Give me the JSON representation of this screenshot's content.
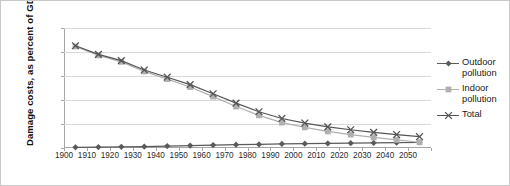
{
  "chart_data": {
    "type": "line",
    "title": "",
    "xlabel": "",
    "ylabel": "Damage costs, as percent of GDP",
    "x": [
      1905,
      1915,
      1925,
      1935,
      1945,
      1955,
      1965,
      1975,
      1985,
      1995,
      2005,
      2015,
      2025,
      2035,
      2045,
      2055
    ],
    "xtick_labels": [
      "1900",
      "1910",
      "1920",
      "1930",
      "1940",
      "1950",
      "1960",
      "1970",
      "1980",
      "1990",
      "2000",
      "2010",
      "2020",
      "2030",
      "2040",
      "2050"
    ],
    "ytick_labels": [
      "0%",
      "10%",
      "20%",
      "30%",
      "40%",
      "50%"
    ],
    "ytick_values": [
      0,
      10,
      20,
      30,
      40,
      50
    ],
    "ylim": [
      0,
      50
    ],
    "grid": true,
    "legend_position": "right",
    "series": [
      {
        "name": "Outdoor pollution",
        "marker": "diamond",
        "color": "#5a5a5a",
        "values": [
          0.3,
          0.4,
          0.5,
          0.6,
          0.8,
          1.0,
          1.2,
          1.4,
          1.5,
          1.7,
          1.8,
          1.9,
          2.0,
          2.1,
          2.2,
          2.3
        ]
      },
      {
        "name": "Indoor pollution",
        "marker": "square",
        "color": "#b0b0b0",
        "values": [
          42.3,
          38.6,
          35.9,
          31.9,
          28.7,
          25.4,
          21.4,
          17.3,
          13.6,
          10.6,
          8.6,
          6.9,
          5.6,
          4.4,
          3.4,
          2.4
        ]
      },
      {
        "name": "Total",
        "marker": "x",
        "color": "#555555",
        "values": [
          42.6,
          39.0,
          36.4,
          32.5,
          29.5,
          26.4,
          22.6,
          18.7,
          15.1,
          12.3,
          10.4,
          8.8,
          7.6,
          6.5,
          5.6,
          4.7
        ]
      }
    ]
  },
  "legend": {
    "items": [
      {
        "label_line1": "Outdoor",
        "label_line2": "pollution"
      },
      {
        "label_line1": "Indoor",
        "label_line2": "pollution"
      },
      {
        "label_line1": "Total",
        "label_line2": ""
      }
    ]
  }
}
